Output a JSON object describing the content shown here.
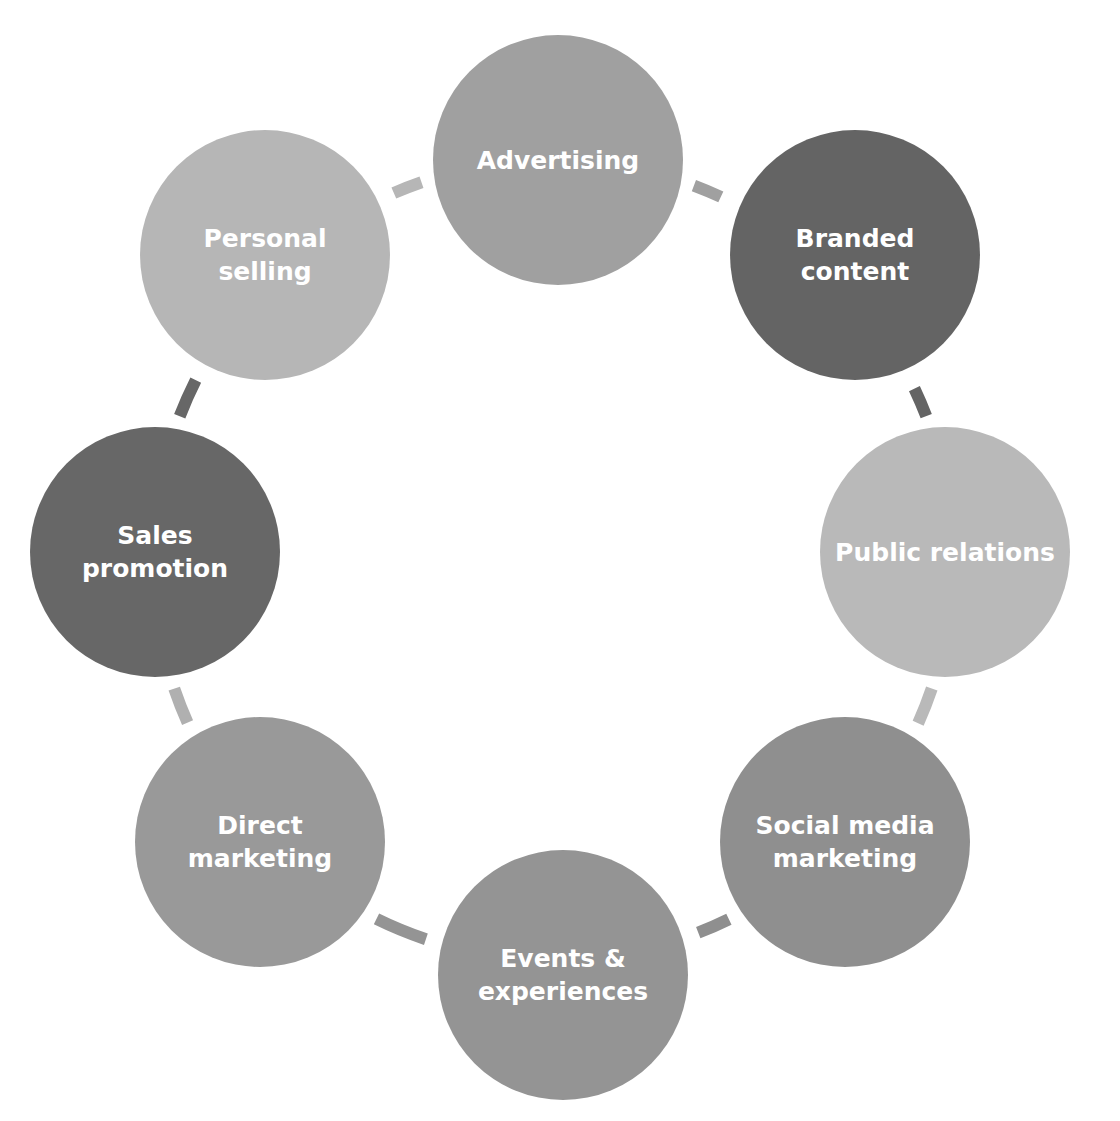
{
  "diagram": {
    "type": "cycle",
    "ring": {
      "cx": 553,
      "cy": 560,
      "r": 400,
      "stroke_width": 12
    },
    "nodes": [
      {
        "id": "advertising",
        "label": "Advertising",
        "cx": 558,
        "cy": 160,
        "r": 125,
        "color": "#a0a0a0"
      },
      {
        "id": "branded-content",
        "label": "Branded\ncontent",
        "cx": 855,
        "cy": 255,
        "r": 125,
        "color": "#646464"
      },
      {
        "id": "public-relations",
        "label": "Public relations",
        "cx": 945,
        "cy": 552,
        "r": 125,
        "color": "#b9b9b9"
      },
      {
        "id": "social-media-marketing",
        "label": "Social media\nmarketing",
        "cx": 845,
        "cy": 842,
        "r": 125,
        "color": "#8f8f8f"
      },
      {
        "id": "events-experiences",
        "label": "Events &\nexperiences",
        "cx": 563,
        "cy": 975,
        "r": 125,
        "color": "#949494"
      },
      {
        "id": "direct-marketing",
        "label": "Direct\nmarketing",
        "cx": 260,
        "cy": 842,
        "r": 125,
        "color": "#999999"
      },
      {
        "id": "sales-promotion",
        "label": "Sales\npromotion",
        "cx": 155,
        "cy": 552,
        "r": 125,
        "color": "#676767"
      },
      {
        "id": "personal-selling",
        "label": "Personal\nselling",
        "cx": 265,
        "cy": 255,
        "r": 125,
        "color": "#b6b6b6"
      }
    ],
    "connectors": [
      {
        "from": "advertising",
        "to": "branded-content",
        "color": "#a0a0a0"
      },
      {
        "from": "branded-content",
        "to": "public-relations",
        "color": "#646464"
      },
      {
        "from": "public-relations",
        "to": "social-media-marketing",
        "color": "#b9b9b9"
      },
      {
        "from": "social-media-marketing",
        "to": "events-experiences",
        "color": "#8f8f8f"
      },
      {
        "from": "events-experiences",
        "to": "direct-marketing",
        "color": "#949494"
      },
      {
        "from": "direct-marketing",
        "to": "sales-promotion",
        "color": "#b0b0b0"
      },
      {
        "from": "sales-promotion",
        "to": "personal-selling",
        "color": "#676767"
      },
      {
        "from": "personal-selling",
        "to": "advertising",
        "color": "#b6b6b6"
      }
    ]
  }
}
